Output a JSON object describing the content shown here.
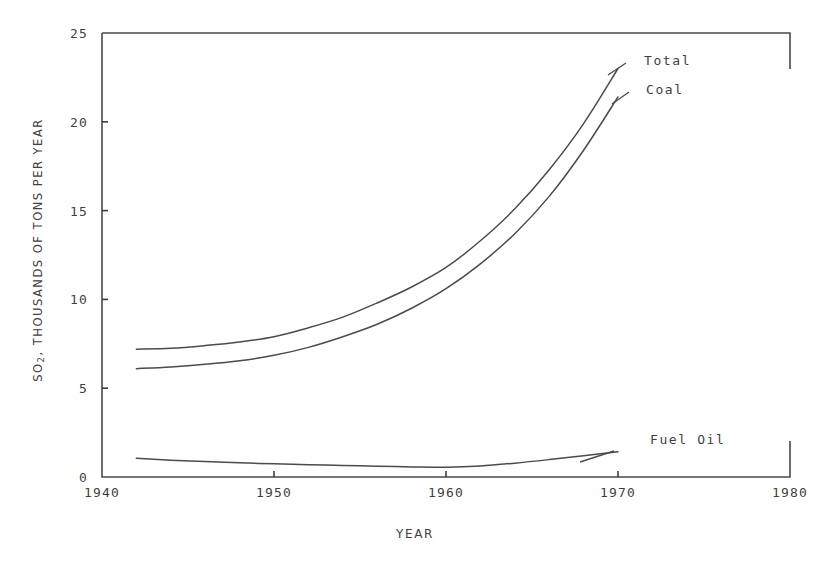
{
  "chart_data": {
    "type": "line",
    "title": "",
    "xlabel": "YEAR",
    "ylabel_prefix": "SO",
    "ylabel_sub": "2",
    "ylabel_rest": ", THOUSANDS OF TONS PER YEAR",
    "ylabel_full": "SO2, THOUSANDS OF TONS PER YEAR",
    "xlim": [
      1940,
      1980
    ],
    "ylim": [
      0,
      25
    ],
    "grid": false,
    "legend_position": "inline-right-of-curve-ends",
    "xticks": [
      {
        "value": 1940,
        "label": "1940"
      },
      {
        "value": 1950,
        "label": "1950"
      },
      {
        "value": 1960,
        "label": "1960"
      },
      {
        "value": 1970,
        "label": "1970"
      },
      {
        "value": 1980,
        "label": "1980"
      }
    ],
    "yticks": [
      {
        "value": 0,
        "label": "0"
      },
      {
        "value": 5,
        "label": "5"
      },
      {
        "value": 10,
        "label": "10"
      },
      {
        "value": 15,
        "label": "15"
      },
      {
        "value": 20,
        "label": "20"
      },
      {
        "value": 25,
        "label": "25"
      }
    ],
    "series": [
      {
        "name": "Total",
        "label": "Total",
        "color": "#4b4b4b",
        "x": [
          1942,
          1944,
          1946,
          1948,
          1950,
          1952,
          1954,
          1956,
          1958,
          1960,
          1962,
          1964,
          1966,
          1968,
          1970
        ],
        "values": [
          7.2,
          7.25,
          7.4,
          7.6,
          7.9,
          8.4,
          9.0,
          9.8,
          10.7,
          11.8,
          13.3,
          15.1,
          17.3,
          19.9,
          23.0
        ]
      },
      {
        "name": "Coal",
        "label": "Coal",
        "color": "#4b4b4b",
        "x": [
          1942,
          1944,
          1946,
          1948,
          1950,
          1952,
          1954,
          1956,
          1958,
          1960,
          1962,
          1964,
          1966,
          1968,
          1970
        ],
        "values": [
          6.1,
          6.2,
          6.35,
          6.55,
          6.85,
          7.3,
          7.9,
          8.6,
          9.5,
          10.6,
          12.0,
          13.7,
          15.8,
          18.4,
          21.4
        ]
      },
      {
        "name": "Fuel Oil",
        "label": "Fuel Oil",
        "color": "#4b4b4b",
        "x": [
          1942,
          1944,
          1946,
          1948,
          1950,
          1952,
          1954,
          1956,
          1958,
          1960,
          1962,
          1964,
          1966,
          1968,
          1970
        ],
        "values": [
          1.05,
          0.95,
          0.87,
          0.8,
          0.74,
          0.69,
          0.65,
          0.61,
          0.57,
          0.55,
          0.62,
          0.78,
          0.98,
          1.2,
          1.42
        ]
      }
    ]
  }
}
